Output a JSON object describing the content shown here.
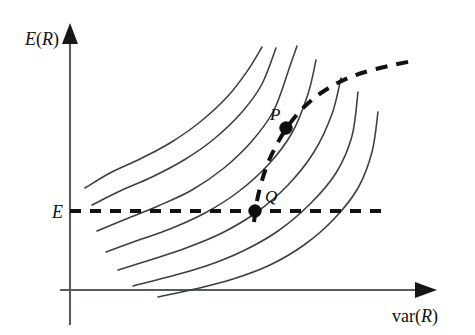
{
  "figure": {
    "kind": "line-diagram",
    "background_color": "#ffffff",
    "ink_color": "#333333",
    "width": 475,
    "height": 335
  },
  "axes": {
    "y_axis": {
      "label_prefix": "E",
      "label_paren_open": "(",
      "label_var": "R",
      "label_paren_close": ")",
      "label_full": "E(R)",
      "arrow": "up-arrowhead",
      "x_position": 70,
      "top": 23,
      "bottom": 325
    },
    "x_axis": {
      "label_prefix": "var",
      "label_paren_open": "(",
      "label_var": "R",
      "label_paren_close": ")",
      "label_full": "var(R)",
      "arrow": "right-arrowhead",
      "y_position": 290,
      "left": 60,
      "right": 437
    }
  },
  "annotations": {
    "level_label": "E",
    "point_p_label": "P",
    "point_q_label": "Q"
  },
  "chart_data": {
    "type": "line",
    "title": "",
    "xlabel": "var(R)",
    "ylabel": "E(R)",
    "grid": false,
    "legend": "none",
    "series": [
      {
        "name": "indifference-curve-1",
        "style": "solid",
        "points": [
          [
            85,
            188
          ],
          [
            110,
            173
          ],
          [
            140,
            159
          ],
          [
            170,
            143
          ],
          [
            200,
            122
          ],
          [
            228,
            96
          ],
          [
            248,
            70
          ],
          [
            262,
            47
          ]
        ]
      },
      {
        "name": "indifference-curve-2",
        "style": "solid",
        "points": [
          [
            92,
            205
          ],
          [
            120,
            191
          ],
          [
            152,
            177
          ],
          [
            184,
            160
          ],
          [
            214,
            139
          ],
          [
            242,
            112
          ],
          [
            262,
            84
          ],
          [
            276,
            48
          ]
        ]
      },
      {
        "name": "indifference-curve-3",
        "style": "solid",
        "points": [
          [
            97,
            231
          ],
          [
            126,
            219
          ],
          [
            158,
            206
          ],
          [
            192,
            190
          ],
          [
            224,
            168
          ],
          [
            252,
            141
          ],
          [
            274,
            110
          ],
          [
            290,
            66
          ],
          [
            297,
            46
          ]
        ]
      },
      {
        "name": "indifference-curve-4",
        "style": "solid",
        "points": [
          [
            106,
            252
          ],
          [
            136,
            241
          ],
          [
            170,
            229
          ],
          [
            205,
            213
          ],
          [
            238,
            192
          ],
          [
            268,
            165
          ],
          [
            292,
            133
          ],
          [
            308,
            94
          ],
          [
            316,
            60
          ]
        ]
      },
      {
        "name": "indifference-curve-5",
        "style": "solid",
        "points": [
          [
            118,
            270
          ],
          [
            150,
            260
          ],
          [
            186,
            248
          ],
          [
            222,
            233
          ],
          [
            257,
            212
          ],
          [
            288,
            185
          ],
          [
            314,
            152
          ],
          [
            332,
            114
          ],
          [
            341,
            78
          ]
        ]
      },
      {
        "name": "indifference-curve-6",
        "style": "solid",
        "points": [
          [
            133,
            286
          ],
          [
            168,
            277
          ],
          [
            206,
            266
          ],
          [
            243,
            251
          ],
          [
            278,
            231
          ],
          [
            310,
            204
          ],
          [
            336,
            173
          ],
          [
            352,
            136
          ],
          [
            358,
            92
          ]
        ]
      },
      {
        "name": "indifference-curve-7",
        "style": "solid",
        "points": [
          [
            158,
            297
          ],
          [
            195,
            289
          ],
          [
            233,
            279
          ],
          [
            270,
            265
          ],
          [
            304,
            245
          ],
          [
            334,
            219
          ],
          [
            358,
            188
          ],
          [
            372,
            152
          ],
          [
            378,
            112
          ]
        ]
      },
      {
        "name": "efficient-frontier",
        "style": "dashed",
        "points": [
          [
            254,
            222
          ],
          [
            258,
            196
          ],
          [
            266,
            168
          ],
          [
            276,
            146
          ],
          [
            288,
            126
          ],
          [
            304,
            107
          ],
          [
            324,
            91
          ],
          [
            348,
            78
          ],
          [
            376,
            69
          ],
          [
            412,
            61
          ]
        ]
      },
      {
        "name": "expected-return-level-line",
        "style": "dashed",
        "orientation": "horizontal",
        "points": [
          [
            70,
            211
          ],
          [
            386,
            211
          ]
        ]
      }
    ],
    "markers": [
      {
        "name": "P",
        "x": 286,
        "y": 128,
        "label": "P",
        "label_dx": -16,
        "label_dy": -8
      },
      {
        "name": "Q",
        "x": 255,
        "y": 211,
        "label": "Q",
        "label_dx": 10,
        "label_dy": -9
      }
    ]
  }
}
